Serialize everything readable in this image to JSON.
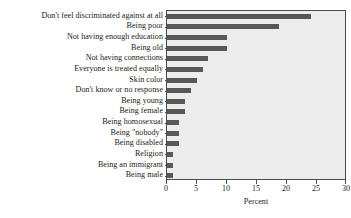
{
  "chart_data": {
    "type": "bar",
    "orientation": "horizontal",
    "title": "",
    "subtitle": "",
    "xlabel": "Percent",
    "ylabel": "",
    "xlim": [
      0,
      30
    ],
    "xticks": [
      0,
      5,
      10,
      15,
      20,
      25,
      30
    ],
    "xtick_labels": [
      "0",
      "5",
      "10",
      "15",
      "20",
      "25",
      "30"
    ],
    "grid": false,
    "legend": null,
    "bar_color": "#575757",
    "panel_color": "#ececec",
    "frame_color": "#4a4a4a",
    "categories": [
      "Don't feel discriminated against at all",
      "Being poor",
      "Not having enough education",
      "Being old",
      "Not having connections",
      "Everyone is treated equally",
      "Skin color",
      "Don't know or no response",
      "Being young",
      "Being female",
      "Being homosexual",
      "Being \"nobody\"",
      "Being disabled",
      "Religion",
      "Being an immigrant",
      "Being male"
    ],
    "values": [
      24,
      18.7,
      10,
      10,
      6.8,
      6,
      5,
      4,
      3,
      3,
      2,
      2,
      2,
      1,
      1,
      1
    ]
  }
}
